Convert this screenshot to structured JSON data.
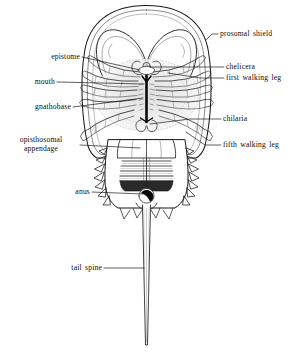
{
  "figure": {
    "view": "ventral",
    "background_color": "#ffffff",
    "ink_color": "#1a1a1a",
    "width": 293,
    "height": 357
  },
  "labels": {
    "prosomal_shield": "prosomal shield",
    "epistome": "epistome",
    "chelicera": "chelicera",
    "first_walking_leg": "first walking leg",
    "mouth": "mouth",
    "gnathobase": "gnathobase",
    "chilaria": "chilaria",
    "opisthosomal_appendage_line1": "opisthosomal",
    "opisthosomal_appendage_line2": "appendage",
    "fifth_walking_leg": "fifth walking leg",
    "anus": "anus",
    "tail_spine": "tail spine"
  },
  "label_list": [
    {
      "id": "prosomal-shield",
      "text": "prosomal shield",
      "side": "right"
    },
    {
      "id": "epistome",
      "text": "epistome",
      "side": "left"
    },
    {
      "id": "chelicera",
      "text": "chelicera",
      "side": "right"
    },
    {
      "id": "first-walking-leg",
      "text": "first walking leg",
      "side": "right"
    },
    {
      "id": "mouth",
      "text": "mouth",
      "side": "left"
    },
    {
      "id": "gnathobase",
      "text": "gnathobase",
      "side": "left"
    },
    {
      "id": "chilaria",
      "text": "chilaria",
      "side": "right"
    },
    {
      "id": "opisthosomal-appendage",
      "text": "opisthosomal appendage",
      "side": "left"
    },
    {
      "id": "fifth-walking-leg",
      "text": "fifth walking leg",
      "side": "right"
    },
    {
      "id": "anus",
      "text": "anus",
      "side": "left"
    },
    {
      "id": "tail-spine",
      "text": "tail spine",
      "side": "left"
    }
  ]
}
